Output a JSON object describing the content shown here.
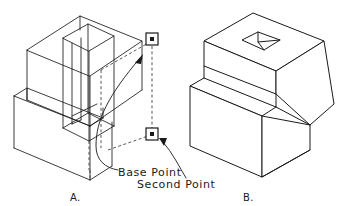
{
  "figure": {
    "background_color": "#ffffff",
    "line_color": "#1a1a1a",
    "dashed_color": "#3a3a3a",
    "width": 354,
    "height": 206
  },
  "annotations": {
    "base_point_label": "Base  Point",
    "second_point_label": "Second  Point"
  },
  "captions": {
    "left": "A.",
    "right": "B."
  },
  "markers": {
    "second_point": {
      "name": "second-point-marker",
      "x": 152,
      "y": 39
    },
    "base_point": {
      "name": "base-point-marker",
      "x": 152,
      "y": 134
    }
  },
  "icons": {
    "base_point": "square-point-marker-icon",
    "second_point": "square-point-marker-icon",
    "arrow_up": "arrowhead-icon",
    "arrow_down": "arrowhead-icon"
  }
}
